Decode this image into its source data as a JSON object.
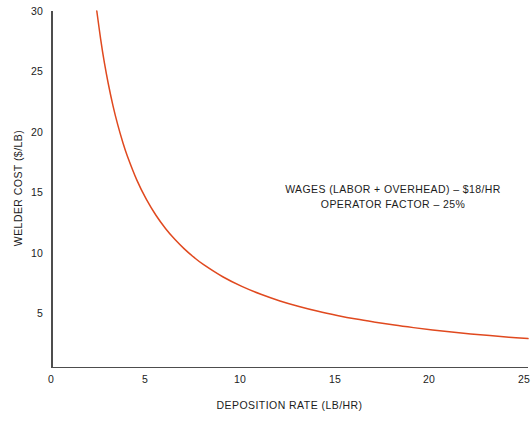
{
  "chart_data": {
    "type": "line",
    "title": "",
    "xlabel": "DEPOSITION RATE (LB/HR)",
    "ylabel": "WELDER COST ($/LB)",
    "xlim": [
      0,
      25
    ],
    "ylim": [
      0,
      30
    ],
    "xticks": [
      "0",
      "5",
      "10",
      "15",
      "20",
      "25"
    ],
    "xtick_values": [
      0,
      5,
      10,
      15,
      20,
      25
    ],
    "yticks": [
      "5",
      "10",
      "15",
      "20",
      "25",
      "30"
    ],
    "ytick_values": [
      5,
      10,
      15,
      20,
      25,
      30
    ],
    "grid": false,
    "legend": null,
    "series": [
      {
        "name": "Welder cost vs deposition rate",
        "color": "#e0491f",
        "formula": "cost = wages / (operator_factor * deposition_rate) = 72 / rate",
        "x": [
          2.4,
          2.6,
          2.8,
          3.0,
          3.25,
          3.5,
          3.75,
          4.0,
          4.5,
          5.0,
          5.5,
          6.0,
          6.5,
          7.0,
          7.5,
          8.0,
          9.0,
          10.0,
          11.0,
          12.0,
          13.0,
          14.0,
          15.0,
          16.0,
          17.0,
          18.0,
          19.0,
          20.0,
          21.0,
          22.0,
          23.0,
          24.0,
          25.0
        ],
        "y": [
          30.0,
          27.7,
          25.7,
          24.0,
          22.15,
          20.57,
          19.2,
          18.0,
          16.0,
          14.4,
          13.09,
          12.0,
          11.08,
          10.29,
          9.6,
          9.0,
          8.0,
          7.2,
          6.55,
          6.0,
          5.54,
          5.14,
          4.8,
          4.5,
          4.24,
          4.0,
          3.79,
          3.6,
          3.43,
          3.27,
          3.13,
          3.0,
          2.88
        ]
      }
    ],
    "annotations": [
      "WAGES (LABOR + OVERHEAD) – $18/HR",
      "OPERATOR FACTOR – 25%"
    ],
    "parameters": {
      "wages_label": "WAGES (LABOR + OVERHEAD)",
      "wages_value": "$18/HR",
      "operator_factor_label": "OPERATOR FACTOR",
      "operator_factor_value": "25%"
    }
  },
  "colors": {
    "curve": "#e0491f",
    "axis": "#4d4d4d",
    "text": "#1c1c1c",
    "background": "#ffffff"
  }
}
